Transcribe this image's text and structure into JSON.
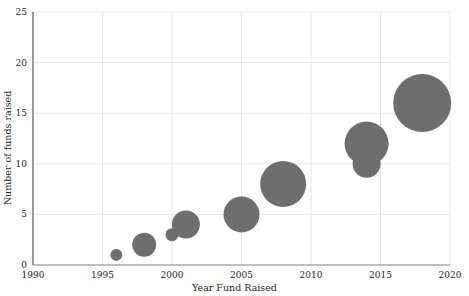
{
  "chart_data": {
    "type": "scatter",
    "subtype": "bubble",
    "title": "",
    "xlabel": "Year Fund Raised",
    "ylabel": "Number of funds raised",
    "xlim": [
      1990,
      2020
    ],
    "ylim": [
      0,
      25
    ],
    "xticks": [
      1990,
      1995,
      2000,
      2005,
      2010,
      2015,
      2020
    ],
    "yticks": [
      0,
      5,
      10,
      15,
      20,
      25
    ],
    "xtick_labels": [
      "1990",
      "1995",
      "2000",
      "2005",
      "2010",
      "2015",
      "2020"
    ],
    "ytick_labels": [
      "0",
      "5",
      "10",
      "15",
      "20",
      "25"
    ],
    "grid": "both-light",
    "legend": "none",
    "marker_color": "#6e6e6e",
    "axis_color": "#808080",
    "grid_color": "#e8e8e8",
    "points": [
      {
        "label": "1996",
        "x": 1996,
        "y": 1,
        "r": 6
      },
      {
        "label": "1998",
        "x": 1998,
        "y": 2,
        "r": 12
      },
      {
        "label": "2000",
        "x": 2000,
        "y": 3,
        "r": 6.5
      },
      {
        "label": "2001",
        "x": 2001,
        "y": 4,
        "r": 14
      },
      {
        "label": "2005",
        "x": 2005,
        "y": 5,
        "r": 18
      },
      {
        "label": "2008",
        "x": 2008,
        "y": 8,
        "r": 23
      },
      {
        "label": "2014a",
        "x": 2014,
        "y": 10,
        "r": 14
      },
      {
        "label": "2014b",
        "x": 2014,
        "y": 12,
        "r": 22
      },
      {
        "label": "2018",
        "x": 2018,
        "y": 16,
        "r": 29
      }
    ]
  },
  "plot_geometry": {
    "left": 33,
    "right": 450,
    "top": 12,
    "bottom": 265
  }
}
